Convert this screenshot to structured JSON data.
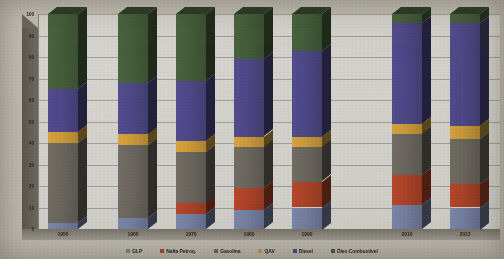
{
  "chart_data": {
    "type": "bar",
    "title": "",
    "xlabel": "",
    "ylabel": "",
    "ylim": [
      0,
      100
    ],
    "yticks": [
      0,
      10,
      20,
      30,
      40,
      50,
      60,
      70,
      80,
      90,
      100
    ],
    "grid": true,
    "stacked": true,
    "legend_position": "bottom",
    "categories": [
      "1950",
      "1960",
      "1970",
      "1980",
      "1990",
      "2010",
      "2013"
    ],
    "series": [
      {
        "name": "GLP",
        "color": "#7b86ab",
        "values": [
          3,
          5,
          7,
          9,
          10,
          11,
          10
        ]
      },
      {
        "name": "Nafta Petroq.",
        "color": "#b4462a",
        "values": [
          0,
          0,
          5,
          10,
          12,
          14,
          11
        ]
      },
      {
        "name": "Gasolina",
        "color": "#6f6b63",
        "values": [
          37,
          34,
          24,
          19,
          16,
          19,
          21
        ]
      },
      {
        "name": "QAV",
        "color": "#d2a13c",
        "values": [
          5,
          5,
          5,
          5,
          5,
          5,
          6
        ]
      },
      {
        "name": "Diesel",
        "color": "#504a8c",
        "values": [
          20,
          24,
          28,
          36,
          40,
          47,
          48
        ]
      },
      {
        "name": "Óleo Combustível",
        "color": "#46603c",
        "values": [
          35,
          32,
          31,
          21,
          17,
          4,
          4
        ]
      }
    ]
  },
  "axis": {
    "y_labels": [
      "100",
      "90",
      "80",
      "70",
      "60",
      "50",
      "40",
      "30",
      "20",
      "10",
      "0"
    ]
  },
  "legend": {
    "items": [
      {
        "label": "GLP",
        "color": "#7b86ab"
      },
      {
        "label": "Nafta Petroq.",
        "color": "#b4462a"
      },
      {
        "label": "Gasolina",
        "color": "#6f6b63"
      },
      {
        "label": "QAV",
        "color": "#d2a13c"
      },
      {
        "label": "Diesel",
        "color": "#504a8c"
      },
      {
        "label": "Óleo Combustível",
        "color": "#46603c"
      }
    ]
  }
}
